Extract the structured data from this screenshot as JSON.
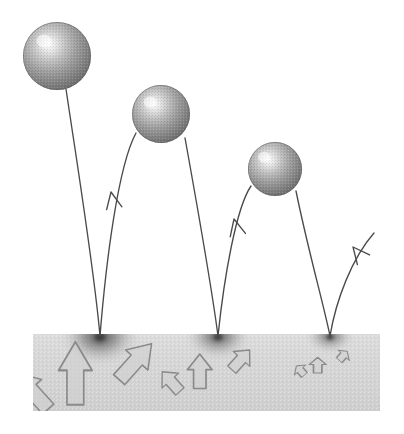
{
  "figure": {
    "type": "physics-illustration",
    "canvas": {
      "width": 404,
      "height": 434,
      "background": "#ffffff"
    }
  },
  "palette": {
    "background": "#ffffff",
    "slab_fill": "#d4d4d4",
    "slab_fill_light": "#dedede",
    "slab_fill_dark": "#c6c6c6",
    "sphere_highlight": "#fafafa",
    "sphere_mid": "#a8a8a8",
    "sphere_edge": "#6e6e6e",
    "sphere_rim": "#5a5a5a",
    "trajectory_stroke": "#4a4a4a",
    "impact_smudge": "#3a3a3a",
    "arrow_fill": "#cfcfcf",
    "arrow_stroke": "#8a8a8a"
  },
  "slab": {
    "label": "ground-slab",
    "x": 33,
    "y": 334,
    "width": 347,
    "height": 77
  },
  "spheres": [
    {
      "label": "ball-bounce-1",
      "cx": 57,
      "cy": 56,
      "r": 34,
      "highlight_x": 44,
      "highlight_y": 41
    },
    {
      "label": "ball-bounce-2",
      "cx": 161,
      "cy": 114,
      "r": 29,
      "highlight_x": 150,
      "highlight_y": 102
    },
    {
      "label": "ball-bounce-3",
      "cx": 275,
      "cy": 169,
      "r": 27,
      "highlight_x": 264,
      "highlight_y": 157
    }
  ],
  "impacts": [
    {
      "label": "impact-point-1",
      "x": 100,
      "y": 336,
      "radius": 34,
      "intensity": 0.72
    },
    {
      "label": "impact-point-2",
      "x": 218,
      "y": 336,
      "radius": 28,
      "intensity": 0.62
    },
    {
      "label": "impact-point-3",
      "x": 330,
      "y": 336,
      "radius": 21,
      "intensity": 0.52
    }
  ],
  "trajectories": [
    {
      "label": "descent-path-1",
      "kind": "descent",
      "path": "M 66 89 C 78 170 94 268 100 336"
    },
    {
      "label": "ascent-path-1",
      "kind": "ascent",
      "path": "M 100 336 C 106 262 118 166 136 133"
    },
    {
      "label": "descent-path-2",
      "kind": "descent",
      "path": "M 185 138 C 198 210 212 290 218 336"
    },
    {
      "label": "ascent-path-2",
      "kind": "ascent",
      "path": "M 218 336 C 224 278 236 208 251 186"
    },
    {
      "label": "descent-path-3",
      "kind": "descent",
      "path": "M 296 191 C 308 250 324 306 330 336"
    },
    {
      "label": "ascent-path-3",
      "kind": "ascent",
      "path": "M 330 336 C 336 300 352 258 374 233"
    }
  ],
  "trajectory_arrowheads": [
    {
      "label": "ascent-arrowhead-1",
      "x": 111,
      "y": 192,
      "angle": -14
    },
    {
      "label": "ascent-arrowhead-2",
      "x": 234,
      "y": 219,
      "angle": -16
    },
    {
      "label": "ascent-arrowhead-3",
      "x": 353,
      "y": 247,
      "angle": -42
    }
  ],
  "arrow_clusters": [
    {
      "label": "energy-arrows-1",
      "center_x": 100,
      "base_y": 340,
      "scale": 1.0,
      "arrows": [
        {
          "label": "arrow-down-left",
          "direction": "down-left",
          "angle": -42
        },
        {
          "label": "arrow-down",
          "direction": "down",
          "angle": 0
        },
        {
          "label": "arrow-down-right",
          "direction": "down-right",
          "angle": 42
        }
      ]
    },
    {
      "label": "energy-arrows-2",
      "center_x": 218,
      "base_y": 340,
      "scale": 0.74,
      "arrows": [
        {
          "label": "arrow-down-left",
          "direction": "down-left",
          "angle": -42
        },
        {
          "label": "arrow-down",
          "direction": "down",
          "angle": 0
        },
        {
          "label": "arrow-down-right",
          "direction": "down-right",
          "angle": 42
        }
      ]
    },
    {
      "label": "energy-arrows-3",
      "center_x": 330,
      "base_y": 340,
      "scale": 0.5,
      "arrows": [
        {
          "label": "arrow-down-left",
          "direction": "down-left",
          "angle": -42
        },
        {
          "label": "arrow-down",
          "direction": "down",
          "angle": 0
        },
        {
          "label": "arrow-down-right",
          "direction": "down-right",
          "angle": 42
        }
      ]
    }
  ]
}
